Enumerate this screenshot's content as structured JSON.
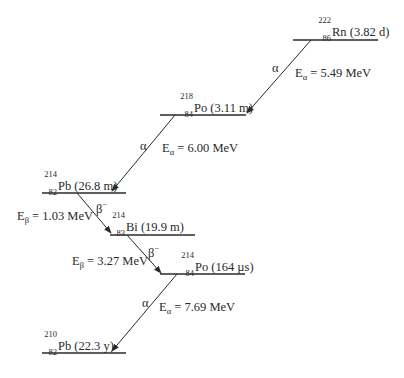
{
  "diagram": {
    "levels": [
      {
        "id": "rn222",
        "mass": "222",
        "z": "86",
        "symbol": "Rn",
        "halflife": "(3.82 d)"
      },
      {
        "id": "po218",
        "mass": "218",
        "z": "84",
        "symbol": "Po",
        "halflife": "(3.11 m)"
      },
      {
        "id": "pb214",
        "mass": "214",
        "z": "82",
        "symbol": "Pb",
        "halflife": "(26.8 m)"
      },
      {
        "id": "bi214",
        "mass": "214",
        "z": "83",
        "symbol": "Bi",
        "halflife": "(19.9 m)"
      },
      {
        "id": "po214",
        "mass": "214",
        "z": "84",
        "symbol": "Po",
        "halflife": "(164 µs)"
      },
      {
        "id": "pb210",
        "mass": "210",
        "z": "82",
        "symbol": "Pb",
        "halflife": "(22.3 y)"
      }
    ],
    "transitions": [
      {
        "from": "rn222",
        "to": "po218",
        "type": "α",
        "energy_prefix": "E",
        "energy_sub": "α",
        "energy_value": "= 5.49 MeV"
      },
      {
        "from": "po218",
        "to": "pb214",
        "type": "α",
        "energy_prefix": "E",
        "energy_sub": "α",
        "energy_value": "= 6.00 MeV"
      },
      {
        "from": "pb214",
        "to": "bi214",
        "type": "β",
        "type_sup": "−",
        "energy_prefix": "E",
        "energy_sub": "β",
        "energy_value": "= 1.03 MeV"
      },
      {
        "from": "bi214",
        "to": "po214",
        "type": "β",
        "type_sup": "−",
        "energy_prefix": "E",
        "energy_sub": "β",
        "energy_value": "= 3.27 MeV"
      },
      {
        "from": "po214",
        "to": "pb210",
        "type": "α",
        "energy_prefix": "E",
        "energy_sub": "α",
        "energy_value": "= 7.69 MeV"
      }
    ],
    "colors": {
      "line": "#2a2a2a",
      "text": "#2a2a2a",
      "background": "#ffffff"
    }
  }
}
